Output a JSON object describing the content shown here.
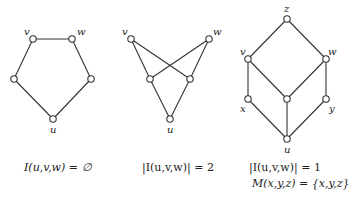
{
  "diagrams": [
    {
      "name": "pentagon",
      "nodes": [
        {
          "id": "v",
          "x": 33,
          "y": 39,
          "label": "v",
          "lx": 24,
          "ly": 27
        },
        {
          "id": "w",
          "x": 72,
          "y": 39,
          "label": "w",
          "lx": 77,
          "ly": 27
        },
        {
          "id": "a",
          "x": 14,
          "y": 79,
          "label": ""
        },
        {
          "id": "b",
          "x": 91,
          "y": 79,
          "label": ""
        },
        {
          "id": "u",
          "x": 53,
          "y": 119,
          "label": "u",
          "lx": 50,
          "ly": 125
        }
      ],
      "edges": [
        [
          "v",
          "w"
        ],
        [
          "v",
          "a"
        ],
        [
          "a",
          "u"
        ],
        [
          "w",
          "b"
        ],
        [
          "b",
          "u"
        ]
      ],
      "caption": [
        "I(u,v,w) = ∅"
      ]
    },
    {
      "name": "crossed",
      "nodes": [
        {
          "id": "v",
          "x": 131,
          "y": 39,
          "label": "v",
          "lx": 122,
          "ly": 27
        },
        {
          "id": "w",
          "x": 209,
          "y": 39,
          "label": "w",
          "lx": 213,
          "ly": 27
        },
        {
          "id": "a",
          "x": 150,
          "y": 79,
          "label": ""
        },
        {
          "id": "b",
          "x": 190,
          "y": 79,
          "label": ""
        },
        {
          "id": "u",
          "x": 170,
          "y": 119,
          "label": "u",
          "lx": 167,
          "ly": 125
        }
      ],
      "edges": [
        [
          "v",
          "a"
        ],
        [
          "v",
          "b"
        ],
        [
          "w",
          "a"
        ],
        [
          "w",
          "b"
        ],
        [
          "a",
          "u"
        ],
        [
          "b",
          "u"
        ]
      ],
      "caption": [
        "|I(u,v,w)| = 2"
      ]
    },
    {
      "name": "cube",
      "nodes": [
        {
          "id": "z",
          "x": 287,
          "y": 19,
          "label": "z",
          "lx": 284,
          "ly": 4
        },
        {
          "id": "v",
          "x": 248,
          "y": 59,
          "label": "v",
          "lx": 240,
          "ly": 47
        },
        {
          "id": "w",
          "x": 326,
          "y": 59,
          "label": "w",
          "lx": 328,
          "ly": 47
        },
        {
          "id": "x",
          "x": 248,
          "y": 99,
          "label": "x",
          "lx": 240,
          "ly": 104
        },
        {
          "id": "m",
          "x": 287,
          "y": 99,
          "label": ""
        },
        {
          "id": "y",
          "x": 326,
          "y": 99,
          "label": "y",
          "lx": 329,
          "ly": 104
        },
        {
          "id": "u",
          "x": 287,
          "y": 139,
          "label": "u",
          "lx": 284,
          "ly": 145
        }
      ],
      "edges": [
        [
          "z",
          "v"
        ],
        [
          "z",
          "w"
        ],
        [
          "v",
          "x"
        ],
        [
          "v",
          "m"
        ],
        [
          "w",
          "m"
        ],
        [
          "w",
          "y"
        ],
        [
          "x",
          "u"
        ],
        [
          "m",
          "u"
        ],
        [
          "y",
          "u"
        ]
      ],
      "caption": [
        "|I(u,v,w)| = 1",
        "M(x,y,z) = {x,y,z}"
      ]
    }
  ],
  "captions": {
    "c1": "I(u,v,w) = ∅",
    "c2": "|I(u,v,w)| = 2",
    "c3a": "|I(u,v,w)| = 1",
    "c3b": "M(x,y,z) = {x,y,z}"
  },
  "colors": {
    "stroke": "#333333",
    "node_fill": "#ffffff",
    "background": "#ffffff"
  }
}
